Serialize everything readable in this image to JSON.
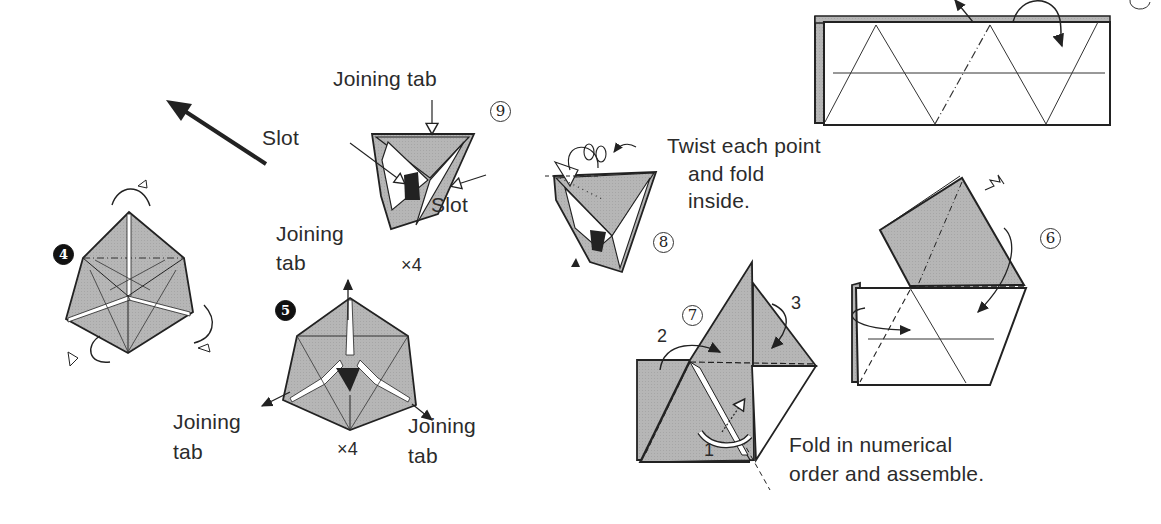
{
  "diagram": {
    "type": "origami-instructions",
    "colors": {
      "paper_colored": "#b4b4b4",
      "paper_white": "#ffffff",
      "line": "#222222",
      "background": "#ffffff"
    },
    "steps": [
      {
        "id": "step-4",
        "number": "4",
        "style": "filled-circle"
      },
      {
        "id": "step-5",
        "number": "5",
        "style": "filled-circle"
      },
      {
        "id": "step-6",
        "number": "6",
        "style": "outlined-circle"
      },
      {
        "id": "step-7",
        "number": "7",
        "style": "outlined-circle"
      },
      {
        "id": "step-8",
        "number": "8",
        "style": "outlined-circle"
      },
      {
        "id": "step-9",
        "number": "9",
        "style": "outlined-circle"
      }
    ],
    "labels": {
      "step9_joining_tab": "Joining tab",
      "step9_slot_left": "Slot",
      "step9_slot_right": "Slot",
      "step9_multiplier": "×4",
      "step8_instruction_line1": "Twist each point",
      "step8_instruction_line2": "and fold",
      "step8_instruction_line3": "inside.",
      "step5_joining_tab_top_line1": "Joining",
      "step5_joining_tab_top_line2": "tab",
      "step5_joining_tab_left_line1": "Joining",
      "step5_joining_tab_left_line2": "tab",
      "step5_joining_tab_right_line1": "Joining",
      "step5_joining_tab_right_line2": "tab",
      "step5_multiplier": "×4",
      "step7_fold_1": "1",
      "step7_fold_2": "2",
      "step7_fold_3": "3",
      "step7_instruction_line1": "Fold in numerical",
      "step7_instruction_line2": "order and assemble."
    }
  }
}
